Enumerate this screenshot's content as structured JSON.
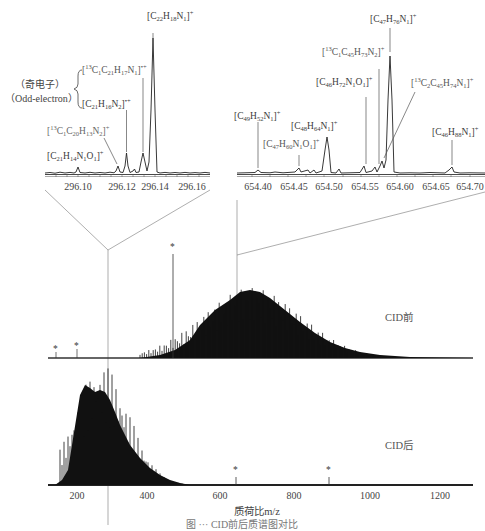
{
  "chart_data": [
    {
      "type": "line",
      "title": "Zoom inset (m/z ≈ 296)",
      "xlabel": "",
      "ylabel": "",
      "xlim": [
        296.09,
        296.17
      ],
      "x_ticks": [
        "296.10",
        "296.12",
        "296.14",
        "296.16"
      ],
      "grid": false,
      "peaks": [
        {
          "mz": 296.104,
          "rel_intensity": 0.12,
          "label": "[C21H14N1O1]+"
        },
        {
          "mz": 296.125,
          "rel_intensity": 0.15,
          "label": "[13C1C20H13N2]+"
        },
        {
          "mz": 296.128,
          "rel_intensity": 0.27,
          "label": "[C21H16N2]•+"
        },
        {
          "mz": 296.137,
          "rel_intensity": 0.27,
          "label": "[13C1C21H17N1]•+"
        },
        {
          "mz": 296.14,
          "rel_intensity": 1.0,
          "label": "[C22H18N1]+"
        }
      ],
      "annotations": [
        "（奇电子）",
        "（Odd-electron）"
      ]
    },
    {
      "type": "line",
      "title": "Zoom inset (m/z ≈ 654)",
      "xlabel": "",
      "ylabel": "",
      "xlim": [
        654.37,
        654.71
      ],
      "x_ticks": [
        "654.40",
        "654.45",
        "654.50",
        "654.55",
        "654.60",
        "654.65",
        "654.70"
      ],
      "grid": false,
      "peaks": [
        {
          "mz": 654.4,
          "rel_intensity": 0.05,
          "label": "[C49H52N1]+"
        },
        {
          "mz": 654.46,
          "rel_intensity": 0.08,
          "label": "[C47H60N1O1]+"
        },
        {
          "mz": 654.49,
          "rel_intensity": 0.35,
          "label": "[C48H64N1]+"
        },
        {
          "mz": 654.55,
          "rel_intensity": 0.08,
          "label": "[C46H72N1O1]+"
        },
        {
          "mz": 654.57,
          "rel_intensity": 0.06,
          "label": "[13C1C45H73N2]+"
        },
        {
          "mz": 654.58,
          "rel_intensity": 0.12,
          "label": "[13C2C45H74N1]+"
        },
        {
          "mz": 654.59,
          "rel_intensity": 1.0,
          "label": "[C47H76N1]+"
        },
        {
          "mz": 654.68,
          "rel_intensity": 0.07,
          "label": "[C46H88N1]+"
        }
      ]
    },
    {
      "type": "bar",
      "title": "CID前",
      "xlabel": "质荷比m/z",
      "xlim": [
        150,
        1300
      ],
      "envelope_center": 700,
      "envelope_range": [
        350,
        1250
      ],
      "marked_peaks": [
        {
          "mz": 170,
          "marker": "*"
        },
        {
          "mz": 205,
          "marker": "*"
        },
        {
          "mz": 475,
          "marker": "*",
          "rel_intensity": 0.9
        }
      ],
      "zoom_positions": [
        296,
        654
      ]
    },
    {
      "type": "bar",
      "title": "CID后",
      "xlabel": "质荷比m/z",
      "xlim": [
        150,
        1300
      ],
      "x_ticks": [
        "200",
        "400",
        "600",
        "800",
        "1000",
        "1200"
      ],
      "envelope_center": 290,
      "envelope_range": [
        170,
        500
      ],
      "marked_peaks": [
        {
          "mz": 645,
          "marker": "*"
        },
        {
          "mz": 895,
          "marker": "*"
        }
      ]
    }
  ],
  "insets": {
    "left": {
      "ticks": [
        "296.10",
        "296.12",
        "296.14",
        "296.16"
      ],
      "odd_electron_cn": "（奇电子）",
      "odd_electron_en": "（Odd-electron）"
    },
    "right": {
      "ticks": [
        "654.40",
        "654.45",
        "654.50",
        "654.55",
        "654.60",
        "654.65",
        "654.70"
      ]
    }
  },
  "spectra": {
    "before_label": "CID前",
    "after_label": "CID后",
    "star": "*"
  },
  "axis": {
    "ticks": [
      "200",
      "400",
      "600",
      "800",
      "1000",
      "1200"
    ],
    "xlabel": "质荷比m/z"
  },
  "caption": "图  ···  CID前后质谱图对比"
}
